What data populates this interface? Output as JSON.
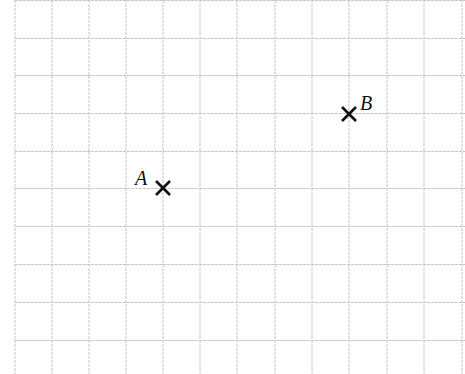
{
  "diagram": {
    "type": "grid-with-points",
    "grid": {
      "color": "#c4c4c4",
      "line_style": "dashed",
      "vertical_lines_x": [
        15,
        52,
        89,
        126,
        163,
        200,
        237,
        275,
        312,
        349,
        387,
        424,
        462
      ],
      "horizontal_lines_y": [
        0,
        38,
        75,
        113,
        151,
        188,
        226,
        264,
        302,
        340
      ],
      "cell_size_px": 37.5
    },
    "points": [
      {
        "label": "A",
        "marker": "cross",
        "x": 163,
        "y": 188,
        "label_x": 135,
        "label_y": 168
      },
      {
        "label": "B",
        "marker": "cross",
        "x": 349,
        "y": 114,
        "label_x": 360,
        "label_y": 93
      }
    ],
    "marker_color": "#111111"
  }
}
